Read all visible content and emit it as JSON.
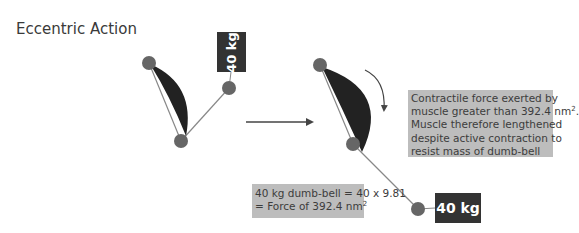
{
  "title": "Eccentric Action",
  "colors": {
    "joint": "#666666",
    "muscle": "#222222",
    "bone": "#888888",
    "weight_box": "#333333",
    "note_box": "#bdbdbd",
    "arrow": "#444444"
  },
  "left_figure": {
    "weight_label": "40 kg"
  },
  "right_figure": {
    "weight_label": "40 kg"
  },
  "transition_arrow": "arrow-right",
  "rotation_arrow": "curved-arrow-clockwise",
  "notes": {
    "right": {
      "line1": "Contractile force exerted by",
      "line2_pre": "muscle greater than 392.4 nm",
      "line2_sup": "2",
      "line2_post": ".",
      "line3": "Muscle therefore lengthened",
      "line4": "despite active contraction to",
      "line5": "resist mass of dumb-bell"
    },
    "bottom": {
      "line1": "40 kg dumb-bell = 40 x 9.81",
      "line2_pre": "= Force of 392.4 nm",
      "line2_sup": "2"
    }
  }
}
